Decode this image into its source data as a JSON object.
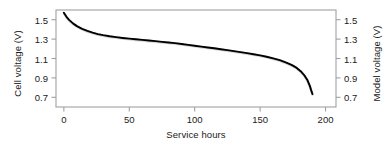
{
  "chart_data": {
    "type": "line",
    "title": "",
    "xlabel": "Service hours",
    "ylabel": "Cell voltage (V)",
    "y2label": "Model voltage (V)",
    "xlim": [
      -6,
      208
    ],
    "ylim": [
      0.6,
      1.6
    ],
    "y2lim": [
      0.6,
      1.6
    ],
    "xticks": [
      0,
      50,
      100,
      150,
      200
    ],
    "xticklabels": [
      "0",
      "50",
      "100",
      "150",
      "200"
    ],
    "yticks": [
      1.5,
      1.3,
      1.1,
      0.9,
      0.7
    ],
    "yticklabels": [
      "1.5",
      "1.3",
      "1.1",
      "0.9",
      "0.7"
    ],
    "y2ticks": [
      1.5,
      1.3,
      1.1,
      0.9,
      0.7
    ],
    "y2ticklabels": [
      "1.5",
      "1.3",
      "1.1",
      "0.9",
      "0.7"
    ],
    "grid": false,
    "legend": "none",
    "frame": "box",
    "tick_direction": "out",
    "colors": {
      "model_line": "#000000",
      "measured_line": "#b4b4b4",
      "frame": "#a0a0a0",
      "text": "#1a1a1a"
    },
    "series": [
      {
        "name": "Measured cell voltage",
        "style": "solid-thin",
        "color": "#b4b4b4",
        "x": [
          0,
          2,
          4,
          7,
          10,
          14,
          18,
          22,
          26,
          30,
          35,
          40,
          45,
          50,
          55,
          60,
          65,
          70,
          75,
          80,
          85,
          90,
          95,
          100,
          105,
          110,
          115,
          120,
          125,
          130,
          135,
          140,
          145,
          150,
          155,
          160,
          165,
          170,
          174,
          178,
          181,
          184,
          186,
          188,
          189,
          190
        ],
        "y": [
          1.568,
          1.525,
          1.492,
          1.456,
          1.428,
          1.4,
          1.378,
          1.36,
          1.346,
          1.335,
          1.323,
          1.314,
          1.306,
          1.299,
          1.292,
          1.286,
          1.279,
          1.273,
          1.266,
          1.259,
          1.252,
          1.244,
          1.235,
          1.226,
          1.217,
          1.208,
          1.199,
          1.19,
          1.18,
          1.17,
          1.16,
          1.149,
          1.138,
          1.126,
          1.112,
          1.096,
          1.077,
          1.052,
          1.028,
          0.997,
          0.963,
          0.917,
          0.876,
          0.812,
          0.768,
          0.728
        ]
      },
      {
        "name": "Model voltage",
        "style": "solid-thick",
        "color": "#000000",
        "x": [
          0,
          2,
          4,
          7,
          10,
          14,
          18,
          22,
          26,
          30,
          35,
          40,
          45,
          50,
          55,
          60,
          65,
          70,
          75,
          80,
          85,
          90,
          95,
          100,
          105,
          110,
          115,
          120,
          125,
          130,
          135,
          140,
          145,
          150,
          155,
          160,
          165,
          170,
          174,
          178,
          181,
          184,
          186,
          188,
          189,
          190
        ],
        "y": [
          1.572,
          1.53,
          1.498,
          1.462,
          1.434,
          1.406,
          1.384,
          1.366,
          1.352,
          1.341,
          1.329,
          1.32,
          1.312,
          1.305,
          1.298,
          1.292,
          1.285,
          1.279,
          1.272,
          1.265,
          1.258,
          1.25,
          1.241,
          1.232,
          1.223,
          1.214,
          1.205,
          1.196,
          1.186,
          1.176,
          1.166,
          1.155,
          1.144,
          1.132,
          1.118,
          1.102,
          1.083,
          1.058,
          1.034,
          1.003,
          0.969,
          0.923,
          0.882,
          0.818,
          0.774,
          0.734
        ]
      }
    ]
  }
}
